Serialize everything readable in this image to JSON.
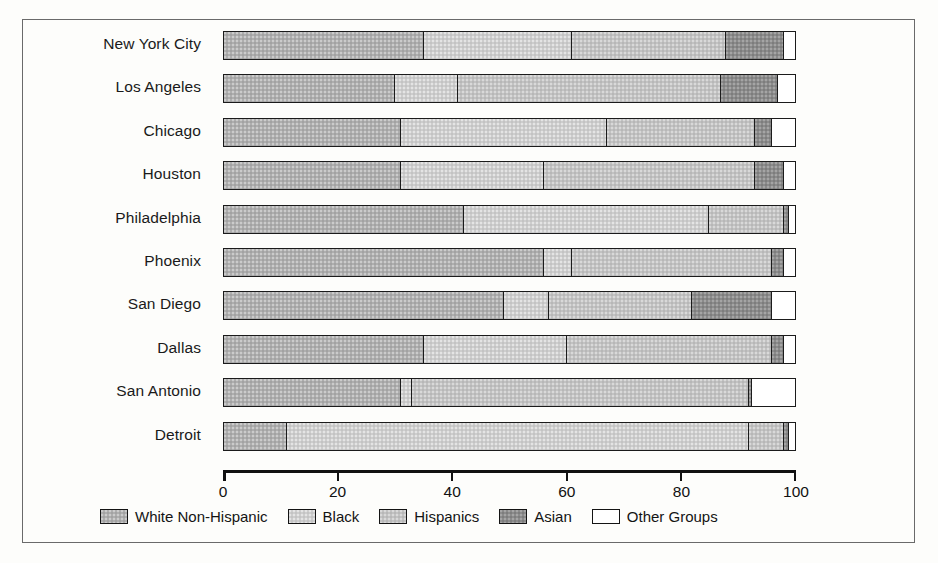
{
  "chart_data": {
    "type": "bar",
    "orientation": "horizontal",
    "stacked": true,
    "title": "",
    "xlabel": "",
    "ylabel": "",
    "xlim": [
      0,
      100
    ],
    "xticks": [
      0,
      20,
      40,
      60,
      80,
      100
    ],
    "xtick_labels": [
      "0",
      "20",
      "40",
      "60",
      "80",
      "100"
    ],
    "grid": false,
    "legend_position": "bottom",
    "categories": [
      "New York City",
      "Los Angeles",
      "Chicago",
      "Houston",
      "Philadelphia",
      "Phoenix",
      "San Diego",
      "Dallas",
      "San Antonio",
      "Detroit"
    ],
    "series": [
      {
        "name": "White Non-Hispanic",
        "color": "#aeaeae",
        "values": [
          35,
          30,
          31,
          31,
          42,
          56,
          49,
          35,
          31,
          11
        ]
      },
      {
        "name": "Black",
        "color": "#cdcdcd",
        "values": [
          26,
          11,
          36,
          25,
          43,
          5,
          8,
          25,
          2,
          81
        ]
      },
      {
        "name": "Hispanics",
        "color": "#c2c2c2",
        "values": [
          27,
          46,
          26,
          37,
          13,
          35,
          25,
          36,
          59,
          6
        ]
      },
      {
        "name": "Asian",
        "color": "#8b8b8b",
        "values": [
          10,
          10,
          3,
          5,
          1,
          2,
          14,
          2,
          0.5,
          1
        ]
      },
      {
        "name": "Other Groups",
        "color": "#ffffff",
        "values": [
          2,
          3,
          4,
          2,
          1,
          2,
          4,
          2,
          7.5,
          1
        ]
      }
    ]
  },
  "legend": {
    "items": [
      {
        "label": "White Non-Hispanic",
        "key": "white-nh"
      },
      {
        "label": "Black",
        "key": "black"
      },
      {
        "label": "Hispanics",
        "key": "hispanics"
      },
      {
        "label": "Asian",
        "key": "asian"
      },
      {
        "label": "Other Groups",
        "key": "other"
      }
    ]
  }
}
